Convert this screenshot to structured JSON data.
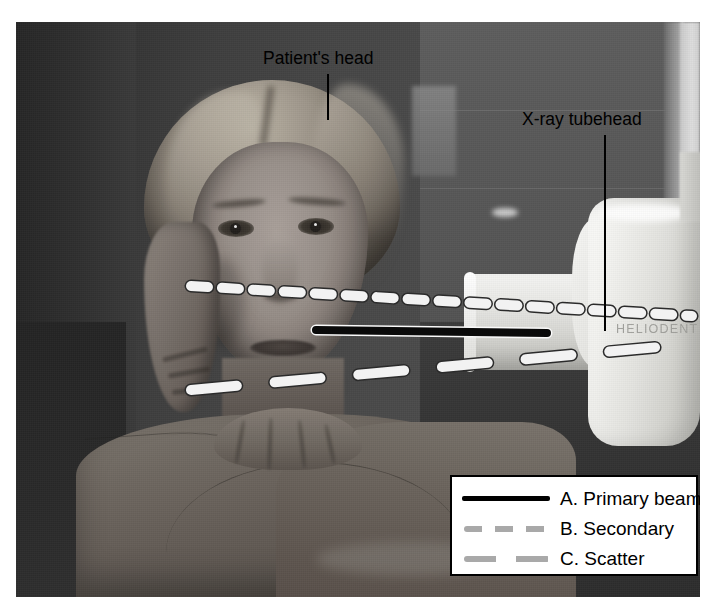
{
  "figure": {
    "type": "annotated-photograph"
  },
  "annotations": [
    {
      "id": "patient-head",
      "label": "Patient's head"
    },
    {
      "id": "xray-tubehead",
      "label": "X-ray tubehead"
    }
  ],
  "photo": {
    "device_brand_text": "HELIODENT"
  },
  "legend": {
    "items": [
      {
        "key": "A",
        "label": "A. Primary beam",
        "style": "solid",
        "color": "#000000"
      },
      {
        "key": "B",
        "label": "B. Secondary",
        "style": "dashed-short",
        "color": "#a9a9a9"
      },
      {
        "key": "C",
        "label": "C. Scatter",
        "style": "dashed-long",
        "color": "#a9a9a9"
      }
    ]
  },
  "beams": {
    "primary": {
      "name": "A. Primary beam",
      "style": "solid",
      "color": "#000000"
    },
    "secondary": {
      "name": "B. Secondary",
      "style": "dashed-short",
      "color": "#f0f0f0"
    },
    "scatter": {
      "name": "C. Scatter",
      "style": "dashed-long",
      "color": "#f0f0f0"
    }
  },
  "colors": {
    "background": "#ffffff",
    "annotation_text": "#000000",
    "legend_border": "#000000",
    "legend_background": "#ffffff",
    "beam_overlay": "#f0f0f0"
  }
}
